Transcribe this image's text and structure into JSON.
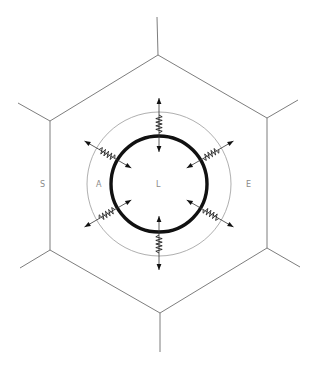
{
  "diagram": {
    "type": "hexagonal cell schematic with elastic springs",
    "colors": {
      "cell_edges": "#6e6e6e",
      "outer_circle": "#9a9a9a",
      "inner_circle": "#111111",
      "labels": "#8a8a8a"
    },
    "labels": {
      "left_region": "S",
      "annulus_left": "A",
      "center": "L",
      "right_region": "E"
    },
    "hexagon": {
      "vertices": [
        [
          158,
          55
        ],
        [
          267,
          118
        ],
        [
          267,
          248
        ],
        [
          160,
          313
        ],
        [
          50,
          250
        ],
        [
          50,
          121
        ]
      ],
      "external_edges": [
        [
          [
            158,
            55
          ],
          [
            157,
            17
          ]
        ],
        [
          [
            267,
            118
          ],
          [
            298,
            100
          ]
        ],
        [
          [
            267,
            248
          ],
          [
            300,
            267
          ]
        ],
        [
          [
            160,
            313
          ],
          [
            160,
            352
          ]
        ],
        [
          [
            50,
            250
          ],
          [
            20,
            268
          ]
        ],
        [
          [
            50,
            121
          ],
          [
            18,
            103
          ]
        ]
      ]
    },
    "circles": {
      "center": [
        159,
        184
      ],
      "inner_radius": 48,
      "outer_radius": 72
    },
    "springs": {
      "count": 6,
      "angles_deg": [
        -90,
        -30,
        30,
        90,
        150,
        210
      ],
      "description": "spring links between inner thick circle and outer thin circle, each with an outward arrow and an inward arrow"
    }
  }
}
